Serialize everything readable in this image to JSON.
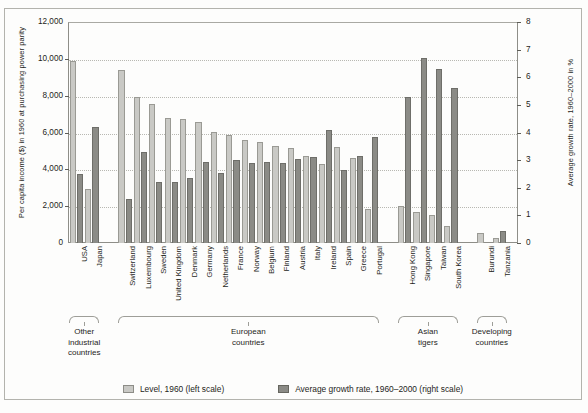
{
  "chart_data": {
    "type": "bar",
    "title": "",
    "ylabel_left": "Per capita income ($) in 1960 at purchasing power parity",
    "ylabel_right": "Average growth rate, 1960–2000 in %",
    "xlabel": "",
    "ylim_left": [
      0,
      12000
    ],
    "ylim_right": [
      0,
      8
    ],
    "yticks_left": [
      "0",
      "2,000",
      "4,000",
      "6,000",
      "8,000",
      "10,000",
      "12,000"
    ],
    "yticks_right": [
      "0",
      "1",
      "2",
      "3",
      "4",
      "5",
      "6",
      "7",
      "8"
    ],
    "grid": true,
    "legend_position": "bottom",
    "categories": [
      "USA",
      "Japan",
      "Switzerland",
      "Luxembourg",
      "Sweden",
      "United Kingdom",
      "Denmark",
      "Germany",
      "Netherlands",
      "France",
      "Norway",
      "Belgium",
      "Finland",
      "Austria",
      "Italy",
      "Ireland",
      "Spain",
      "Greece",
      "Portugal",
      "Hong Kong",
      "Singapore",
      "Taiwan",
      "South Korea",
      "Burundi",
      "Tanzania"
    ],
    "series": [
      {
        "name": "Level, 1960 (left scale)",
        "axis": "left",
        "color": "#c9c9c5",
        "values": [
          9900,
          2950,
          9400,
          7950,
          7550,
          6800,
          6750,
          6550,
          6050,
          5850,
          5600,
          5500,
          5250,
          5150,
          4750,
          4300,
          5200,
          4600,
          1850,
          2000,
          1700,
          1500,
          900,
          550,
          250
        ]
      },
      {
        "name": "Average growth rate, 1960–2000 (right scale)",
        "axis": "right",
        "color": "#8b8b86",
        "values": [
          2.5,
          4.2,
          1.6,
          3.3,
          2.2,
          2.2,
          2.35,
          2.95,
          2.55,
          3.0,
          2.9,
          2.95,
          2.9,
          3.05,
          3.1,
          4.1,
          2.65,
          3.15,
          3.85,
          5.3,
          6.7,
          6.3,
          5.6,
          0.0,
          0.45
        ]
      }
    ],
    "groups": [
      {
        "label": "Other\nindustrial\ncountries",
        "start": 0,
        "end": 1
      },
      {
        "label": "European\ncountries",
        "start": 2,
        "end": 18
      },
      {
        "label": "Asian\ntigers",
        "start": 19,
        "end": 22
      },
      {
        "label": "Developing\ncountries",
        "start": 23,
        "end": 24
      }
    ]
  },
  "legend": {
    "items": [
      {
        "label": "Level, 1960 (left scale)",
        "swatch": "level"
      },
      {
        "label": "Average growth rate, 1960–2000 (right scale)",
        "swatch": "growth"
      }
    ]
  }
}
